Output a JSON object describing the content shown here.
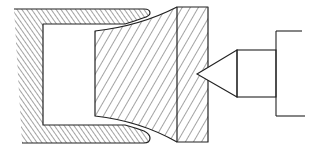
{
  "diagram": {
    "components": [
      {
        "id": "die",
        "label": "C-shaped die (hatched, back-diagonal)"
      },
      {
        "id": "workpiece",
        "label": "Flared workpiece (hatched, forward-diagonal)"
      },
      {
        "id": "end-block",
        "label": "End block (hatched)"
      },
      {
        "id": "indenter",
        "label": "Conical indenter with holder"
      }
    ],
    "colors": {
      "line": "#222222",
      "background": "#ffffff"
    }
  }
}
